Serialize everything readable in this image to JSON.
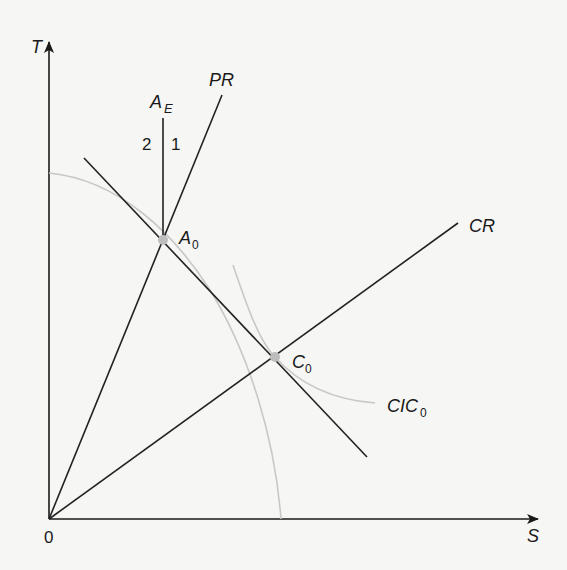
{
  "diagram": {
    "type": "trade-equilibrium-diagram",
    "axes": {
      "x_label": "S",
      "y_label": "T",
      "origin_label": "0"
    },
    "lines": {
      "price_ratio": {
        "label": "PR"
      },
      "consumption_ray": {
        "label": "CR"
      },
      "autarky_vertical": {
        "label_main": "A",
        "label_sub": "E"
      },
      "budget_line": {
        "label": ""
      }
    },
    "regions": {
      "left": "2",
      "right": "1"
    },
    "curves": {
      "production_possibility_frontier": {
        "label": "",
        "color": "#c8c8c8"
      },
      "community_indifference_curve": {
        "label_main": "CIC",
        "label_sub": "0",
        "color": "#c8c8c8"
      }
    },
    "points": {
      "A0": {
        "label_main": "A",
        "label_sub": "0",
        "x": 163,
        "y": 240
      },
      "C0": {
        "label_main": "C",
        "label_sub": "0",
        "x": 275,
        "y": 357
      }
    },
    "colors": {
      "ink": "#1a1a1a",
      "curve_gray": "#c8c8c8",
      "point_gray": "#bdbdbd",
      "background": "#f6f6f4"
    }
  }
}
